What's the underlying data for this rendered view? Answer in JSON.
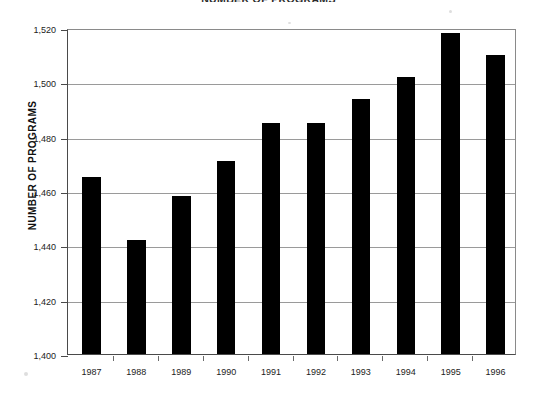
{
  "chart_data": {
    "type": "bar",
    "title": "NUMBER OF PROGRAMS",
    "xlabel": "",
    "ylabel": "NUMBER OF PROGRAMS",
    "categories": [
      "1987",
      "1988",
      "1989",
      "1990",
      "1991",
      "1992",
      "1993",
      "1994",
      "1995",
      "1996"
    ],
    "values": [
      1465,
      1442,
      1458,
      1471,
      1485,
      1485,
      1494,
      1502,
      1518,
      1510
    ],
    "ylim": [
      1400,
      1520
    ],
    "ytick_step": 20,
    "ytick_labels": [
      "1,520",
      "1,500",
      "1,480",
      "1,460",
      "1,440",
      "1,420",
      "1,400"
    ],
    "ytick_values": [
      1520,
      1500,
      1480,
      1460,
      1440,
      1420,
      1400
    ],
    "grid": true,
    "grid_axis": "y",
    "legend": null,
    "bar_color": "#000000",
    "series": [
      {
        "name": "Number of programs",
        "values": [
          1465,
          1442,
          1458,
          1471,
          1485,
          1485,
          1494,
          1502,
          1518,
          1510
        ]
      }
    ]
  },
  "axes": {
    "y_axis_title": "NUMBER OF PROGRAMS"
  }
}
